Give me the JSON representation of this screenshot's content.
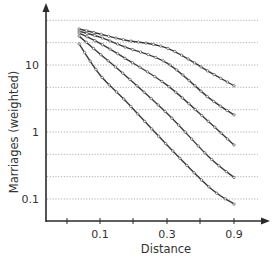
{
  "chart_data": {
    "type": "line",
    "title": "",
    "xlabel": "Distance",
    "ylabel": "Marriages (weighted)",
    "xscale": "log",
    "yscale": "log",
    "x_tick_labels": [
      "0.1",
      "0.3",
      "0.9"
    ],
    "y_tick_labels": [
      "10",
      "1",
      "0.1"
    ],
    "xlim": [
      0.04,
      2.3
    ],
    "ylim": [
      0.05,
      80
    ],
    "grid": {
      "horizontal": true,
      "vertical": false,
      "style": "dotted"
    },
    "legend": null,
    "x": [
      0.071,
      0.1,
      0.15,
      0.3,
      0.6,
      0.9
    ],
    "series": [
      {
        "name": "curve-1",
        "values": [
          34.5,
          29,
          23.6,
          17.9,
          7.9,
          4.9
        ]
      },
      {
        "name": "curve-2",
        "values": [
          32,
          26,
          18.6,
          10.7,
          3.2,
          1.8
        ]
      },
      {
        "name": "curve-3",
        "values": [
          30,
          21,
          12.7,
          5.0,
          1.4,
          0.64
        ]
      },
      {
        "name": "curve-4",
        "values": [
          27,
          14.6,
          7.1,
          1.9,
          0.42,
          0.21
        ]
      },
      {
        "name": "curve-5",
        "values": [
          20.6,
          7.1,
          3.0,
          0.64,
          0.15,
          0.084
        ]
      }
    ],
    "colors": {
      "line": "#3a3a3a",
      "marker": "#555555",
      "grid": "#9a9a9a",
      "axis": "#2a2a2a"
    }
  }
}
